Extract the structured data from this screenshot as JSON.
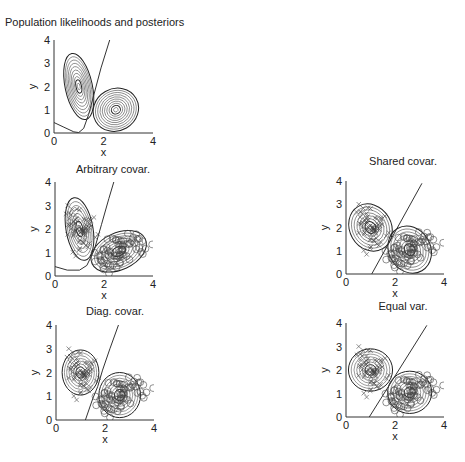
{
  "chart_data": [
    {
      "id": "population",
      "type": "contour",
      "title": "Population likelihoods and posteriors",
      "xlabel": "x",
      "ylabel": "y",
      "xlim": [
        0,
        4
      ],
      "ylim": [
        0,
        4
      ],
      "xticks": [
        "0",
        "2",
        "4"
      ],
      "yticks": [
        "0",
        "1",
        "2",
        "3",
        "4"
      ],
      "box": {
        "x0": 54,
        "x1": 153,
        "y0": 133,
        "y1": 40
      },
      "title_pos": {
        "x": 5,
        "y": 26,
        "anchor": "start"
      },
      "classes": [
        {
          "name": "class 1",
          "mean": [
            1.0,
            2.0
          ],
          "radii": [
            0.55,
            1.45
          ],
          "angle": -12,
          "levels": 10
        },
        {
          "name": "class 2",
          "mean": [
            2.5,
            1.0
          ],
          "radii": [
            0.85,
            1.0
          ],
          "angle": 60,
          "levels": 10
        }
      ],
      "boundary": [
        [
          [
            0,
            0.45
          ],
          [
            0.4,
            0.25
          ],
          [
            0.8,
            0.05
          ],
          [
            1.0,
            0.02
          ],
          [
            1.2,
            0.2
          ],
          [
            1.4,
            0.8
          ],
          [
            1.6,
            1.6
          ],
          [
            1.9,
            2.8
          ],
          [
            2.25,
            4.0
          ]
        ]
      ],
      "points": false
    },
    {
      "id": "arbitrary",
      "type": "scatter+contour",
      "title": "Arbitrary covar.",
      "xlabel": "x",
      "ylabel": "y",
      "xlim": [
        0,
        4
      ],
      "ylim": [
        0,
        4
      ],
      "xticks": [
        "0",
        "2",
        "4"
      ],
      "yticks": [
        "0",
        "1",
        "2",
        "3",
        "4"
      ],
      "box": {
        "x0": 55,
        "x1": 153,
        "y0": 276,
        "y1": 182
      },
      "title_pos": {
        "x": 113,
        "y": 173,
        "anchor": "middle"
      },
      "classes": [
        {
          "name": "class 1 (x)",
          "mean": [
            1.0,
            2.0
          ],
          "radii": [
            0.55,
            1.35
          ],
          "angle": -10,
          "levels": 8
        },
        {
          "name": "class 2 (o)",
          "mean": [
            2.6,
            1.05
          ],
          "radii": [
            0.75,
            1.25
          ],
          "angle": 65,
          "levels": 8
        }
      ],
      "boundary": [
        [
          [
            0,
            0.4
          ],
          [
            0.5,
            0.25
          ],
          [
            1.0,
            0.25
          ],
          [
            1.3,
            0.45
          ],
          [
            1.6,
            1.1
          ],
          [
            1.9,
            2.2
          ],
          [
            2.2,
            3.3
          ],
          [
            2.4,
            4.0
          ]
        ]
      ],
      "points": true
    },
    {
      "id": "shared",
      "type": "scatter+contour",
      "title": "Shared covar.",
      "xlabel": "x",
      "ylabel": "y",
      "xlim": [
        0,
        4
      ],
      "ylim": [
        0,
        4
      ],
      "xticks": [
        "0",
        "2",
        "4"
      ],
      "yticks": [
        "0",
        "1",
        "2",
        "3",
        "4"
      ],
      "box": {
        "x0": 346,
        "x1": 444,
        "y0": 274,
        "y1": 181
      },
      "title_pos": {
        "x": 403,
        "y": 165,
        "anchor": "middle"
      },
      "classes": [
        {
          "name": "class 1 (x)",
          "mean": [
            1.0,
            2.0
          ],
          "radii": [
            0.85,
            1.05
          ],
          "angle": -30,
          "levels": 8
        },
        {
          "name": "class 2 (o)",
          "mean": [
            2.6,
            1.05
          ],
          "radii": [
            0.85,
            1.05
          ],
          "angle": -30,
          "levels": 8
        }
      ],
      "boundary": [
        [
          [
            1.05,
            0.0
          ],
          [
            3.1,
            3.9
          ]
        ]
      ],
      "points": true
    },
    {
      "id": "diagonal",
      "type": "scatter+contour",
      "title": "Diag. covar.",
      "xlabel": "x",
      "ylabel": "y",
      "xlim": [
        0,
        4
      ],
      "ylim": [
        0,
        4
      ],
      "xticks": [
        "0",
        "2",
        "4"
      ],
      "yticks": [
        "0",
        "1",
        "2",
        "3",
        "4"
      ],
      "box": {
        "x0": 56,
        "x1": 154,
        "y0": 420,
        "y1": 325
      },
      "title_pos": {
        "x": 115,
        "y": 315,
        "anchor": "middle"
      },
      "classes": [
        {
          "name": "class 1 (x)",
          "mean": [
            1.0,
            2.0
          ],
          "radii": [
            0.75,
            0.95
          ],
          "angle": 0,
          "levels": 8
        },
        {
          "name": "class 2 (o)",
          "mean": [
            2.6,
            1.05
          ],
          "radii": [
            0.85,
            0.95
          ],
          "angle": 0,
          "levels": 8
        }
      ],
      "boundary": [
        [
          [
            1.2,
            0.0
          ],
          [
            1.5,
            0.9
          ],
          [
            1.7,
            1.4
          ],
          [
            1.9,
            2.1
          ],
          [
            2.2,
            3.0
          ],
          [
            2.55,
            4.0
          ]
        ]
      ],
      "points": true
    },
    {
      "id": "equal",
      "type": "scatter+contour",
      "title": "Equal var.",
      "xlabel": "x",
      "ylabel": "y",
      "xlim": [
        0,
        4
      ],
      "ylim": [
        0,
        4
      ],
      "xticks": [
        "0",
        "2",
        "4"
      ],
      "yticks": [
        "0",
        "1",
        "2",
        "3",
        "4"
      ],
      "box": {
        "x0": 346,
        "x1": 444,
        "y0": 417,
        "y1": 323
      },
      "title_pos": {
        "x": 403,
        "y": 310,
        "anchor": "middle"
      },
      "classes": [
        {
          "name": "class 1 (x)",
          "mean": [
            1.0,
            2.0
          ],
          "radii": [
            0.9,
            0.9
          ],
          "angle": 0,
          "levels": 8
        },
        {
          "name": "class 2 (o)",
          "mean": [
            2.6,
            1.05
          ],
          "radii": [
            0.9,
            0.9
          ],
          "angle": 0,
          "levels": 8
        }
      ],
      "boundary": [
        [
          [
            0.95,
            0.0
          ],
          [
            3.3,
            3.9
          ]
        ]
      ],
      "points": true
    }
  ],
  "samples": {
    "class1": {
      "marker": "x",
      "mean": [
        1.0,
        2.0
      ],
      "sd": [
        0.28,
        0.45
      ],
      "rho": -0.25,
      "n": 70,
      "seed": 7
    },
    "class2": {
      "marker": "o",
      "mean": [
        2.6,
        1.05
      ],
      "sd": [
        0.5,
        0.38
      ],
      "rho": 0.45,
      "n": 70,
      "seed": 19
    }
  }
}
